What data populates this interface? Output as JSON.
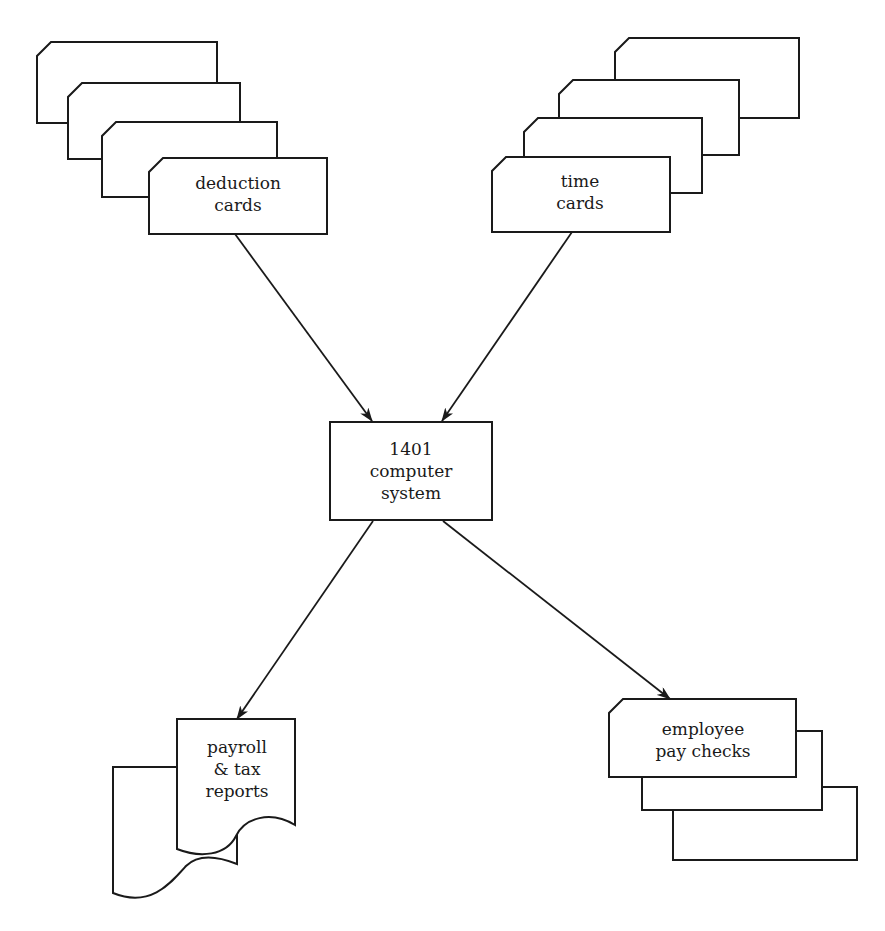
{
  "diagram": {
    "title": "",
    "nodes": {
      "deduction_cards": {
        "line1": "deduction",
        "line2": "cards",
        "shape": "punched-card-deck"
      },
      "time_cards": {
        "line1": "time",
        "line2": "cards",
        "shape": "punched-card-deck"
      },
      "computer": {
        "line1": "1401",
        "line2": "computer",
        "line3": "system",
        "shape": "process-box"
      },
      "reports": {
        "line1": "payroll",
        "line2": "& tax",
        "line3": "reports",
        "shape": "document-stack"
      },
      "paychecks": {
        "line1": "employee",
        "line2": "pay checks",
        "shape": "card-stack"
      }
    },
    "edges": [
      {
        "from": "deduction_cards",
        "to": "computer"
      },
      {
        "from": "time_cards",
        "to": "computer"
      },
      {
        "from": "computer",
        "to": "reports"
      },
      {
        "from": "computer",
        "to": "paychecks"
      }
    ],
    "colors": {
      "line": "#1a1a1a",
      "background": "#ffffff"
    }
  }
}
